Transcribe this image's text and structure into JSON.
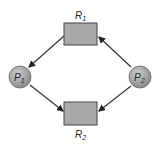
{
  "diagram": {
    "type": "resource-allocation-graph",
    "resources": [
      {
        "id": "R1",
        "label": "R",
        "sub": "1"
      },
      {
        "id": "R2",
        "label": "R",
        "sub": "2"
      }
    ],
    "processes": [
      {
        "id": "P1",
        "label": "P",
        "sub": "1"
      },
      {
        "id": "P2",
        "label": "P",
        "sub": "2"
      }
    ],
    "edges": [
      {
        "from": "R1",
        "to": "P1"
      },
      {
        "from": "P2",
        "to": "R1"
      },
      {
        "from": "P1",
        "to": "R2"
      },
      {
        "from": "P2",
        "to": "R2"
      }
    ],
    "colors": {
      "resource_fill": "#a9a9a9",
      "process_fill": "#a0a0a0",
      "stroke": "#333333"
    }
  }
}
